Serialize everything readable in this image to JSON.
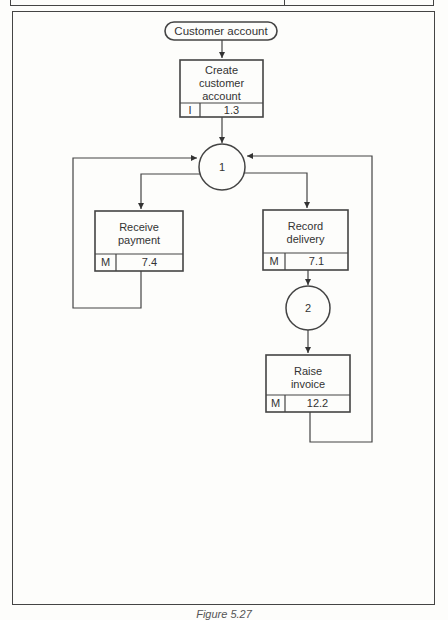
{
  "figure": {
    "caption": "Figure 5.27",
    "top_strip": {
      "divider_present": true
    }
  },
  "diagram": {
    "entity": {
      "label": "Customer account"
    },
    "nodes": [
      {
        "id": "create",
        "title": "Create\ncustomer\naccount",
        "title_lines": [
          "Create",
          "customer",
          "account"
        ],
        "type_code": "I",
        "ref": "1.3"
      },
      {
        "id": "receive",
        "title_lines": [
          "Receive",
          "payment"
        ],
        "type_code": "M",
        "ref": "7.4"
      },
      {
        "id": "record",
        "title_lines": [
          "Record",
          "delivery"
        ],
        "type_code": "M",
        "ref": "7.1"
      },
      {
        "id": "raise",
        "title_lines": [
          "Raise",
          "invoice"
        ],
        "type_code": "M",
        "ref": "12.2"
      }
    ],
    "states": [
      {
        "id": "s1",
        "label": "1"
      },
      {
        "id": "s2",
        "label": "2"
      }
    ],
    "colors": {
      "line": "#444444",
      "background": "#fdfdfb",
      "text": "#333333"
    }
  }
}
